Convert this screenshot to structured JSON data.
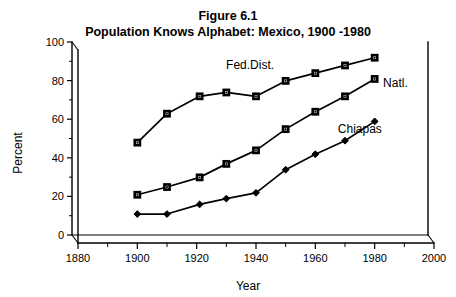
{
  "chart_data": {
    "type": "line",
    "title": "Figure 6.1",
    "subtitle": "Population Knows Alphabet: Mexico, 1900 -1980",
    "xlabel": "Year",
    "ylabel": "Percent",
    "xlim": [
      1880,
      2000
    ],
    "ylim": [
      0,
      100
    ],
    "xticks": [
      1880,
      1900,
      1920,
      1940,
      1960,
      1980,
      2000
    ],
    "xticklabels": [
      "1880",
      "1900",
      "1920",
      "1940",
      "1960",
      "1980",
      "2000"
    ],
    "xminorticks": [
      1890,
      1910,
      1930,
      1950,
      1970,
      1990
    ],
    "yticks": [
      0,
      20,
      40,
      60,
      80,
      100
    ],
    "yticklabels": [
      "0",
      "20",
      "40",
      "60",
      "80",
      "100"
    ],
    "yminorticks": [
      10,
      30,
      50,
      70,
      90
    ],
    "grid": false,
    "legend_position": "inline-annotations",
    "style": "3d-walls",
    "series": [
      {
        "name": "Fed.Dist.",
        "marker": "open-square",
        "label_x": 1938,
        "label_y": 90,
        "x": [
          1900,
          1910,
          1921,
          1930,
          1940,
          1950,
          1960,
          1970,
          1980
        ],
        "y": [
          52,
          67,
          76,
          78,
          76,
          84,
          88,
          92,
          96
        ]
      },
      {
        "name": "Natl.",
        "marker": "open-square",
        "label_x": 1987,
        "label_y": 81,
        "x": [
          1900,
          1910,
          1921,
          1930,
          1940,
          1950,
          1960,
          1970,
          1980
        ],
        "y": [
          25,
          29,
          34,
          41,
          48,
          59,
          68,
          76,
          85
        ]
      },
      {
        "name": "Chiapas",
        "marker": "filled-diamond",
        "label_x": 1975,
        "label_y": 57,
        "x": [
          1900,
          1910,
          1921,
          1930,
          1940,
          1950,
          1960,
          1970,
          1980
        ],
        "y": [
          15,
          15,
          20,
          23,
          26,
          38,
          46,
          53,
          63
        ]
      }
    ]
  }
}
